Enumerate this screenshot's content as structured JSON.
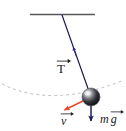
{
  "figure": {
    "type": "free-body-diagram",
    "background_color": "#ffffff"
  },
  "colors": {
    "ceiling": "#58585c",
    "string": "#1c1c4e",
    "tension_arrow": "#2b2b8f",
    "weight_arrow": "#1c1c5e",
    "velocity_arrow": "#e8472a",
    "trajectory_dash": "#bdbdc4",
    "bob_dark": "#1a1a1a",
    "bob_highlight": "#e8e8ec",
    "bob_rim": "#5a5a60",
    "label_text": "#1a1a1a"
  },
  "elements": {
    "ceiling": {
      "name": "ceiling-support",
      "x1": 30,
      "y1": 14,
      "x2": 95,
      "y2": 14
    },
    "pivot": {
      "name": "pivot-point",
      "x": 62,
      "y": 15
    },
    "string": {
      "name": "pendulum-string",
      "x1": 62,
      "y1": 15,
      "x2": 91,
      "y2": 97
    },
    "bob": {
      "name": "pendulum-bob",
      "cx": 91,
      "cy": 97,
      "r": 9
    },
    "trajectory": {
      "name": "swing-arc",
      "description": "dashed arc showing the swing path of the bob",
      "dash": "3,3"
    }
  },
  "vectors": [
    {
      "id": "tension",
      "name": "tension-vector",
      "symbol": "T",
      "label": "T",
      "has_arrow_accent": true,
      "direction": "along string toward pivot (up-left)",
      "color": "#2b2b8f"
    },
    {
      "id": "velocity",
      "name": "velocity-vector",
      "symbol": "v",
      "label": "v",
      "has_arrow_accent": true,
      "direction": "tangent to arc, down-left",
      "color": "#e8472a"
    },
    {
      "id": "weight",
      "name": "weight-vector",
      "symbol": "mg",
      "label_m": "m",
      "label_g": "g",
      "has_arrow_accent": true,
      "direction": "vertically downward",
      "color": "#1c1c5e"
    }
  ]
}
